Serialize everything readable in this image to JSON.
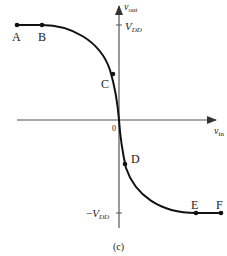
{
  "figure": {
    "caption": "(c)",
    "axes": {
      "y_label_main": "v",
      "y_label_sub": "out",
      "x_label_main": "v",
      "x_label_sub": "in",
      "origin_label": "0",
      "y_ticks": [
        {
          "label_main": "V",
          "label_sub": "DD",
          "value": 1
        },
        {
          "label_prefix": "−",
          "label_main": "V",
          "label_sub": "DD",
          "value": -1
        }
      ]
    },
    "points": [
      {
        "id": "A",
        "label": "A"
      },
      {
        "id": "B",
        "label": "B"
      },
      {
        "id": "C",
        "label": "C"
      },
      {
        "id": "D",
        "label": "D"
      },
      {
        "id": "E",
        "label": "E"
      },
      {
        "id": "F",
        "label": "F"
      }
    ]
  }
}
